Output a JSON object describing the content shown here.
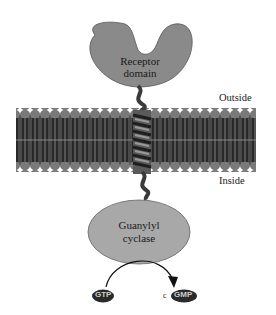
{
  "diagram": {
    "labels": {
      "receptor_line1": "Receptor",
      "receptor_line2": "domain",
      "outside": "Outside",
      "inside": "Inside",
      "cyclase_line1": "Guanylyl",
      "cyclase_line2": "cyclase",
      "substrate": "GTP",
      "product_prefix": "c",
      "product": "GMP"
    },
    "colors": {
      "protein_fill": "#8a8a8a",
      "cyclase_fill": "#a8a8a8",
      "membrane_head": "#7a7a7a",
      "membrane_tail": "#2e2e2e",
      "helix": "#3a3a3a",
      "text": "#1a1a1a"
    }
  }
}
